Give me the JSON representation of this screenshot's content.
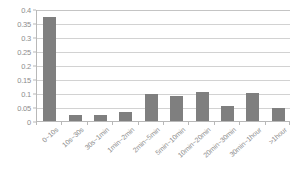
{
  "chart_data": {
    "type": "bar",
    "title": "",
    "subtitle": "",
    "xlabel": "",
    "ylabel": "",
    "ylim": [
      0,
      0.4
    ],
    "yticks": [
      "0",
      "0.05",
      "0.1",
      "0.15",
      "0.2",
      "0.25",
      "0.3",
      "0.35",
      "0.4"
    ],
    "ytick_values": [
      0,
      0.05,
      0.1,
      0.15,
      0.2,
      0.25,
      0.3,
      0.35,
      0.4
    ],
    "grid": true,
    "legend": false,
    "legend_position": "none",
    "bar_color": "#7f7f7f",
    "grid_color": "#d2d2d2",
    "axis_color": "#b8b8b8",
    "tick_label_color": "#8c8c8c",
    "categories": [
      "0~10s",
      "10s~30s",
      "30s~1min",
      "1min~2min",
      "2min~5min",
      "5min~10min",
      "10min~20min",
      "20min~30min",
      "30min~1hour",
      ">1hour"
    ],
    "values": [
      0.372,
      0.023,
      0.023,
      0.032,
      0.098,
      0.088,
      0.105,
      0.055,
      0.1,
      0.048
    ]
  }
}
